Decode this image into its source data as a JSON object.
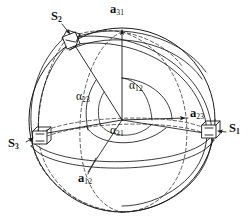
{
  "figure": {
    "background_color": "#ffffff",
    "line_color": "#1a1a1a",
    "dashed_color": "#2b2b2b",
    "joints": [
      {
        "id": "S1",
        "name": "S",
        "subscript": "1",
        "label": "S₁",
        "x": 229,
        "y": 129
      },
      {
        "id": "S2",
        "name": "S",
        "subscript": "2",
        "label": "S₂",
        "x": 55,
        "y": 16
      },
      {
        "id": "S3",
        "name": "S",
        "subscript": "3",
        "label": "S₃",
        "x": 9,
        "y": 144
      }
    ],
    "vectors": [
      {
        "id": "a12",
        "name": "a",
        "subscript": "12",
        "label": "a₁₂",
        "x": 80,
        "y": 179
      },
      {
        "id": "a23",
        "name": "a",
        "subscript": "23",
        "label": "a₂₃",
        "x": 189,
        "y": 113
      },
      {
        "id": "a31",
        "name": "a",
        "subscript": "31",
        "label": "a₃₁",
        "x": 110,
        "y": 5
      }
    ],
    "angles": [
      {
        "id": "alpha12",
        "name": "α",
        "subscript": "12",
        "label": "α₁₂",
        "x": 130,
        "y": 86
      },
      {
        "id": "alpha23",
        "name": "α",
        "subscript": "23",
        "label": "α₂₃",
        "x": 78,
        "y": 95
      },
      {
        "id": "alpha31",
        "name": "α",
        "subscript": "31",
        "label": "α₃₁",
        "x": 111,
        "y": 130
      }
    ],
    "sphere": {
      "center_x": 122,
      "center_y": 120,
      "radius": 93
    }
  }
}
